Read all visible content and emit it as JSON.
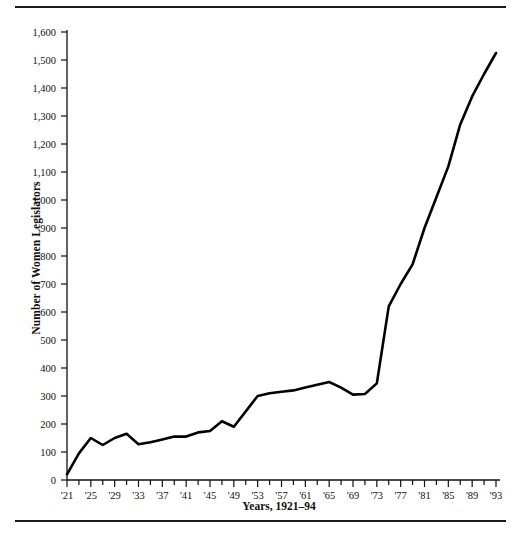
{
  "figure": {
    "top_rule": "horizontal-rule",
    "bottom_rule": "horizontal-rule"
  },
  "chart_data": {
    "type": "line",
    "title": "",
    "xlabel": "Years, 1921–94",
    "ylabel": "Number of Women Legislators",
    "xlim": [
      1921,
      1994
    ],
    "ylim": [
      0,
      1650
    ],
    "grid": false,
    "legend": null,
    "line_color": "#000000",
    "x_tick_labels": [
      "'21",
      "'25",
      "'29",
      "'33",
      "'37",
      "'41",
      "'45",
      "'49",
      "'53",
      "'57",
      "'61",
      "'65",
      "'69",
      "'73",
      "'77",
      "'81",
      "'85",
      "'89",
      "'93"
    ],
    "x_tick_values": [
      1921,
      1925,
      1929,
      1933,
      1937,
      1941,
      1945,
      1949,
      1953,
      1957,
      1961,
      1965,
      1969,
      1973,
      1977,
      1981,
      1985,
      1989,
      1993
    ],
    "x_minor_tick_values": [
      1921,
      1923,
      1925,
      1927,
      1929,
      1931,
      1933,
      1935,
      1937,
      1939,
      1941,
      1943,
      1945,
      1947,
      1949,
      1951,
      1953,
      1955,
      1957,
      1959,
      1961,
      1963,
      1965,
      1967,
      1969,
      1971,
      1973,
      1975,
      1977,
      1979,
      1981,
      1983,
      1985,
      1987,
      1989,
      1991,
      1993
    ],
    "y_tick_labels": [
      "0",
      "100",
      "200",
      "300",
      "400",
      "500",
      "600",
      "700",
      "800",
      "900",
      "1,000",
      "1,100",
      "1,200",
      "1,300",
      "1,400",
      "1,500",
      "1,600"
    ],
    "y_tick_values": [
      0,
      100,
      200,
      300,
      400,
      500,
      600,
      700,
      800,
      900,
      1000,
      1100,
      1200,
      1300,
      1400,
      1500,
      1600
    ],
    "x": [
      1921,
      1923,
      1925,
      1927,
      1929,
      1931,
      1933,
      1935,
      1937,
      1939,
      1941,
      1943,
      1945,
      1947,
      1949,
      1951,
      1953,
      1955,
      1957,
      1959,
      1961,
      1963,
      1965,
      1967,
      1969,
      1971,
      1973,
      1975,
      1977,
      1979,
      1981,
      1983,
      1985,
      1987,
      1989,
      1991,
      1993
    ],
    "values": [
      20,
      95,
      150,
      125,
      150,
      165,
      128,
      135,
      145,
      155,
      155,
      170,
      175,
      210,
      190,
      245,
      300,
      310,
      315,
      320,
      330,
      340,
      350,
      330,
      305,
      307,
      345,
      620,
      700,
      770,
      900,
      1010,
      1120,
      1270,
      1370,
      1450,
      1525
    ]
  }
}
